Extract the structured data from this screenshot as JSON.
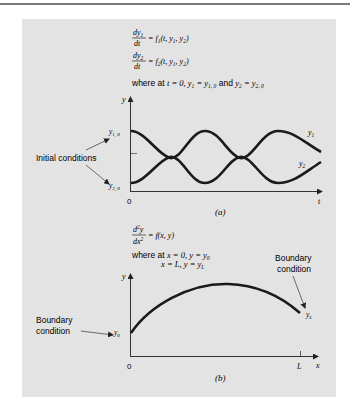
{
  "figure": {
    "panel_color": "#e3e3e3",
    "curve_color": "#1a1a1a",
    "part_a": {
      "eq1_num": "dy",
      "eq1_num_sub": "1",
      "eq1_den": "dt",
      "eq1_rhs": "= f",
      "eq1_rhs_sub": "1",
      "eq1_args": "(t, y",
      "eq1_args_sub1": "1",
      "eq1_args_mid": ", y",
      "eq1_args_sub2": "2",
      "eq1_args_end": ")",
      "eq2_num": "dy",
      "eq2_num_sub": "2",
      "eq2_den": "dt",
      "eq2_rhs": "= f",
      "eq2_rhs_sub": "2",
      "eq2_args": "(t, y",
      "eq2_args_sub1": "1",
      "eq2_args_mid": ", y",
      "eq2_args_sub2": "2",
      "eq2_args_end": ")",
      "condition_prefix": "where at ",
      "condition_t": "t = 0, y",
      "condition_y1_sub": "1",
      "condition_eq1": " = y",
      "condition_y10_sub": "1, 0",
      "condition_and": " and ",
      "condition_y2": "y",
      "condition_y2_sub": "2",
      "condition_eq2": " = y",
      "condition_y20_sub": "2, 0",
      "y_axis_label": "y",
      "x_axis_label": "t",
      "origin_label": "0",
      "y10_label": "y",
      "y10_sub": "1, 0",
      "y20_label": "y",
      "y20_sub": "2, 0",
      "y1_label": "y",
      "y1_sub": "1",
      "y2_label": "y",
      "y2_sub": "2",
      "annotation": "Initial conditions",
      "caption": "(a)"
    },
    "part_b": {
      "eq_num": "d",
      "eq_num_sup": "2",
      "eq_num_end": "y",
      "eq_den": "dx",
      "eq_den_sup": "2",
      "eq_rhs": "= f(x, y)",
      "condition_prefix": "where at ",
      "condition_1": "x = 0, y = y",
      "condition_1_sub": "0",
      "condition_2": "x = L, y = y",
      "condition_2_sub": "L",
      "y_axis_label": "y",
      "x_axis_label": "x",
      "origin_label": "0",
      "L_label": "L",
      "y0_label": "y",
      "y0_sub": "0",
      "yL_label": "y",
      "yL_sub": "L",
      "annotation_left_line1": "Boundary",
      "annotation_left_line2": "condition",
      "annotation_right_line1": "Boundary",
      "annotation_right_line2": "condition",
      "caption": "(b)"
    }
  }
}
